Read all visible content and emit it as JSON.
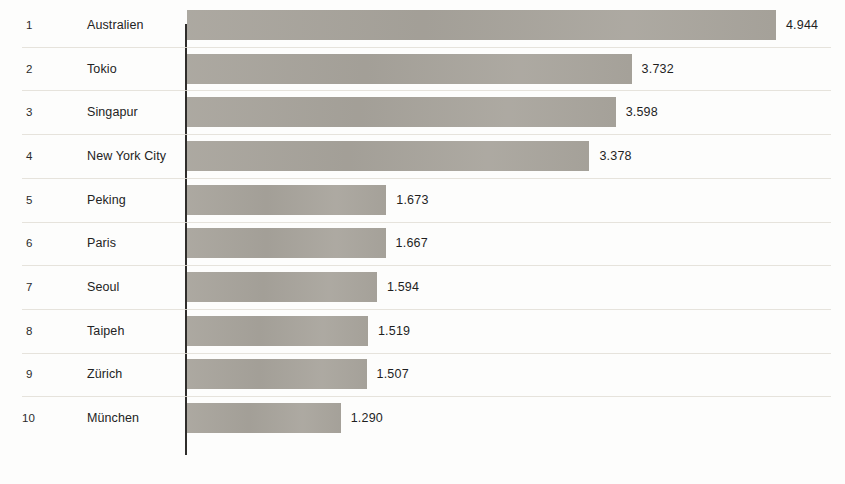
{
  "chart_data": {
    "type": "bar",
    "orientation": "horizontal",
    "title": "",
    "subtitle": "",
    "xlabel": "",
    "ylabel": "",
    "grid": false,
    "legend_position": "none",
    "axis_ranges": {
      "x": [
        0,
        4944
      ]
    },
    "value_format": "german-thousands-dot",
    "colors": {
      "bar": "#a8a49c",
      "text": "#232323",
      "separator": "#e2ded6",
      "axis": "#2f2d2b",
      "background": "#fdfdfc"
    },
    "categories": [
      "Australien",
      "Tokio",
      "Singapur",
      "New York City",
      "Peking",
      "Paris",
      "Seoul",
      "Taipeh",
      "Zürich",
      "München"
    ],
    "values": [
      4944,
      3732,
      3598,
      3378,
      1673,
      1667,
      1594,
      1519,
      1507,
      1290
    ],
    "rows": [
      {
        "rank": "1",
        "label": "Australien",
        "value": 4944,
        "value_label": "4.944"
      },
      {
        "rank": "2",
        "label": "Tokio",
        "value": 3732,
        "value_label": "3.732"
      },
      {
        "rank": "3",
        "label": "Singapur",
        "value": 3598,
        "value_label": "3.598"
      },
      {
        "rank": "4",
        "label": "New York City",
        "value": 3378,
        "value_label": "3.378"
      },
      {
        "rank": "5",
        "label": "Peking",
        "value": 1673,
        "value_label": "1.673"
      },
      {
        "rank": "6",
        "label": "Paris",
        "value": 1667,
        "value_label": "1.667"
      },
      {
        "rank": "7",
        "label": "Seoul",
        "value": 1594,
        "value_label": "1.594"
      },
      {
        "rank": "8",
        "label": "Taipeh",
        "value": 1519,
        "value_label": "1.519"
      },
      {
        "rank": "9",
        "label": "Zürich",
        "value": 1507,
        "value_label": "1.507"
      },
      {
        "rank": "10",
        "label": "München",
        "value": 1290,
        "value_label": "1.290"
      }
    ]
  },
  "layout": {
    "row_pitch": 43.7,
    "first_row_top": 3,
    "bar_height": 30,
    "axis_x": 185,
    "px_per_unit": 0.11913
  }
}
